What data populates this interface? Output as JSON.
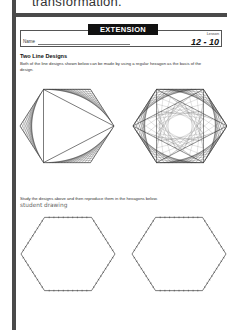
{
  "page": {
    "top_cut_text": "transformation.",
    "banner": "EXTENSION",
    "name_label": "Name",
    "lesson_label": "Lesson",
    "lesson_number": "12 - 10",
    "section_title": "Two Line Designs",
    "intro_text": "Both of the line designs shown below can be made by using a regular hexagon as the basis of the design.",
    "study_text": "Study the designs above and then reproduce them in the hexagons below.",
    "student_note": "student drawing"
  },
  "figures": [
    {
      "name": "triangle-line-design",
      "description": "Hexagon with inscribed triangle, line-stitched corners",
      "center": [
        67,
        126
      ],
      "radius": 47
    },
    {
      "name": "star-line-design",
      "description": "Hexagon with two overlapping triangles forming a star, line-stitched",
      "center": [
        180,
        126
      ],
      "radius": 47
    },
    {
      "name": "blank-hexagon-left",
      "description": "Empty hexagon with tick marks for student drawing",
      "center": [
        68,
        254
      ],
      "radius": 47
    },
    {
      "name": "blank-hexagon-right",
      "description": "Empty hexagon with tick marks for student drawing",
      "center": [
        179,
        254
      ],
      "radius": 47
    }
  ],
  "colors": {
    "frame": "#4a4a4a",
    "banner_bg": "#111111",
    "banner_text": "#ffffff",
    "line_art": "#222222"
  }
}
